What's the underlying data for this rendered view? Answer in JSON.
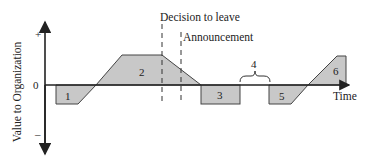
{
  "diagram": {
    "y_axis_label": "Value to Organization",
    "y_ticks": {
      "plus": "+",
      "zero": "0",
      "minus": "–"
    },
    "x_axis_label": "Time",
    "markers": [
      {
        "label": "Decision to leave"
      },
      {
        "label": "Announcement"
      }
    ],
    "phases": [
      {
        "id": "1",
        "label": "1"
      },
      {
        "id": "2",
        "label": "2"
      },
      {
        "id": "3",
        "label": "3"
      },
      {
        "id": "4",
        "label": "4"
      },
      {
        "id": "5",
        "label": "5"
      },
      {
        "id": "6",
        "label": "6"
      }
    ],
    "colors": {
      "fill": "#c8c8c8",
      "stroke": "#333333"
    }
  }
}
